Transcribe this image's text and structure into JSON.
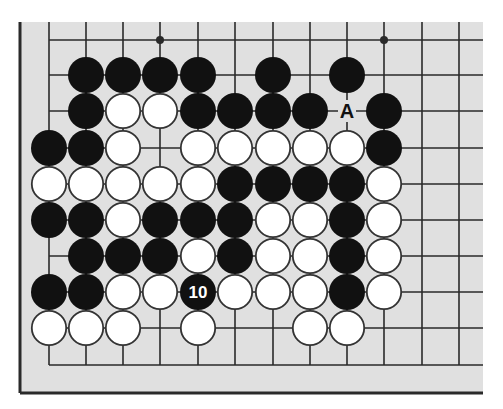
{
  "diagram": {
    "colors": {
      "board_bg": "#e0e0e0",
      "line": "#2a2a2a",
      "black_stone": "#111111",
      "white_stone": "#ffffff",
      "stone_outline": "#333333",
      "label_on_black": "#ffffff",
      "label_on_empty": "#111111"
    },
    "grid": {
      "columns_x": [
        49,
        86,
        123,
        160,
        198,
        235,
        273,
        310,
        347,
        384,
        422,
        459
      ],
      "rows_y": [
        40,
        75,
        111,
        148,
        184,
        220,
        256,
        292,
        328,
        365
      ],
      "top_extent": 22,
      "right_extent": 483,
      "left_edge_col": 0,
      "bottom_edge_row": 9
    },
    "frame": {
      "left_x": 20,
      "bottom_y": 393,
      "top_y": 22,
      "right_x": 483
    },
    "star_points": [
      {
        "col": 3,
        "row": 0
      },
      {
        "col": 9,
        "row": 0
      }
    ],
    "stones": [
      {
        "color": "black",
        "col": 1,
        "row": 1
      },
      {
        "color": "black",
        "col": 2,
        "row": 1
      },
      {
        "color": "black",
        "col": 3,
        "row": 1
      },
      {
        "color": "black",
        "col": 4,
        "row": 1
      },
      {
        "color": "black",
        "col": 6,
        "row": 1
      },
      {
        "color": "black",
        "col": 8,
        "row": 1
      },
      {
        "color": "black",
        "col": 1,
        "row": 2
      },
      {
        "color": "white",
        "col": 2,
        "row": 2
      },
      {
        "color": "white",
        "col": 3,
        "row": 2
      },
      {
        "color": "black",
        "col": 4,
        "row": 2
      },
      {
        "color": "black",
        "col": 5,
        "row": 2
      },
      {
        "color": "black",
        "col": 6,
        "row": 2
      },
      {
        "color": "black",
        "col": 7,
        "row": 2
      },
      {
        "color": "black",
        "col": 9,
        "row": 2
      },
      {
        "color": "black",
        "col": 0,
        "row": 3
      },
      {
        "color": "black",
        "col": 1,
        "row": 3
      },
      {
        "color": "white",
        "col": 2,
        "row": 3
      },
      {
        "color": "white",
        "col": 4,
        "row": 3
      },
      {
        "color": "white",
        "col": 5,
        "row": 3
      },
      {
        "color": "white",
        "col": 6,
        "row": 3
      },
      {
        "color": "white",
        "col": 7,
        "row": 3
      },
      {
        "color": "white",
        "col": 8,
        "row": 3
      },
      {
        "color": "black",
        "col": 9,
        "row": 3
      },
      {
        "color": "white",
        "col": 0,
        "row": 4
      },
      {
        "color": "white",
        "col": 1,
        "row": 4
      },
      {
        "color": "white",
        "col": 2,
        "row": 4
      },
      {
        "color": "white",
        "col": 3,
        "row": 4
      },
      {
        "color": "white",
        "col": 4,
        "row": 4
      },
      {
        "color": "black",
        "col": 5,
        "row": 4
      },
      {
        "color": "black",
        "col": 6,
        "row": 4
      },
      {
        "color": "black",
        "col": 7,
        "row": 4
      },
      {
        "color": "black",
        "col": 8,
        "row": 4
      },
      {
        "color": "white",
        "col": 9,
        "row": 4
      },
      {
        "color": "black",
        "col": 0,
        "row": 5
      },
      {
        "color": "black",
        "col": 1,
        "row": 5
      },
      {
        "color": "white",
        "col": 2,
        "row": 5
      },
      {
        "color": "black",
        "col": 3,
        "row": 5
      },
      {
        "color": "black",
        "col": 4,
        "row": 5
      },
      {
        "color": "black",
        "col": 5,
        "row": 5
      },
      {
        "color": "white",
        "col": 6,
        "row": 5
      },
      {
        "color": "white",
        "col": 7,
        "row": 5
      },
      {
        "color": "black",
        "col": 8,
        "row": 5
      },
      {
        "color": "white",
        "col": 9,
        "row": 5
      },
      {
        "color": "black",
        "col": 1,
        "row": 6
      },
      {
        "color": "black",
        "col": 2,
        "row": 6
      },
      {
        "color": "black",
        "col": 3,
        "row": 6
      },
      {
        "color": "white",
        "col": 4,
        "row": 6
      },
      {
        "color": "black",
        "col": 5,
        "row": 6
      },
      {
        "color": "white",
        "col": 6,
        "row": 6
      },
      {
        "color": "white",
        "col": 7,
        "row": 6
      },
      {
        "color": "black",
        "col": 8,
        "row": 6
      },
      {
        "color": "white",
        "col": 9,
        "row": 6
      },
      {
        "color": "black",
        "col": 0,
        "row": 7
      },
      {
        "color": "black",
        "col": 1,
        "row": 7
      },
      {
        "color": "white",
        "col": 2,
        "row": 7
      },
      {
        "color": "white",
        "col": 3,
        "row": 7
      },
      {
        "color": "black",
        "col": 4,
        "row": 7,
        "label": "10"
      },
      {
        "color": "white",
        "col": 5,
        "row": 7
      },
      {
        "color": "white",
        "col": 6,
        "row": 7
      },
      {
        "color": "white",
        "col": 7,
        "row": 7
      },
      {
        "color": "black",
        "col": 8,
        "row": 7
      },
      {
        "color": "white",
        "col": 9,
        "row": 7
      },
      {
        "color": "white",
        "col": 0,
        "row": 8
      },
      {
        "color": "white",
        "col": 1,
        "row": 8
      },
      {
        "color": "white",
        "col": 2,
        "row": 8
      },
      {
        "color": "white",
        "col": 4,
        "row": 8
      },
      {
        "color": "white",
        "col": 7,
        "row": 8
      },
      {
        "color": "white",
        "col": 8,
        "row": 8
      }
    ],
    "markers": [
      {
        "label": "A",
        "col": 8,
        "row": 2
      }
    ],
    "stone_radius": 18
  }
}
